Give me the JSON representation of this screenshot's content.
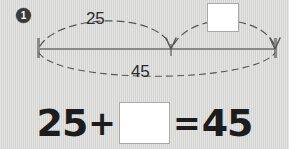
{
  "page": {
    "background_color": "#d7d8d6",
    "ink_color": "#2c2c2c"
  },
  "problem": {
    "number": "1"
  },
  "bar_model": {
    "part_label": "25",
    "whole_label": "45",
    "missing_part_label": "",
    "line_color": "#6e6e6e",
    "arc_color": "#555555"
  },
  "equation": {
    "left_term": "25",
    "operator": "+",
    "missing_term": "",
    "equals": "=",
    "right_term": "45"
  }
}
